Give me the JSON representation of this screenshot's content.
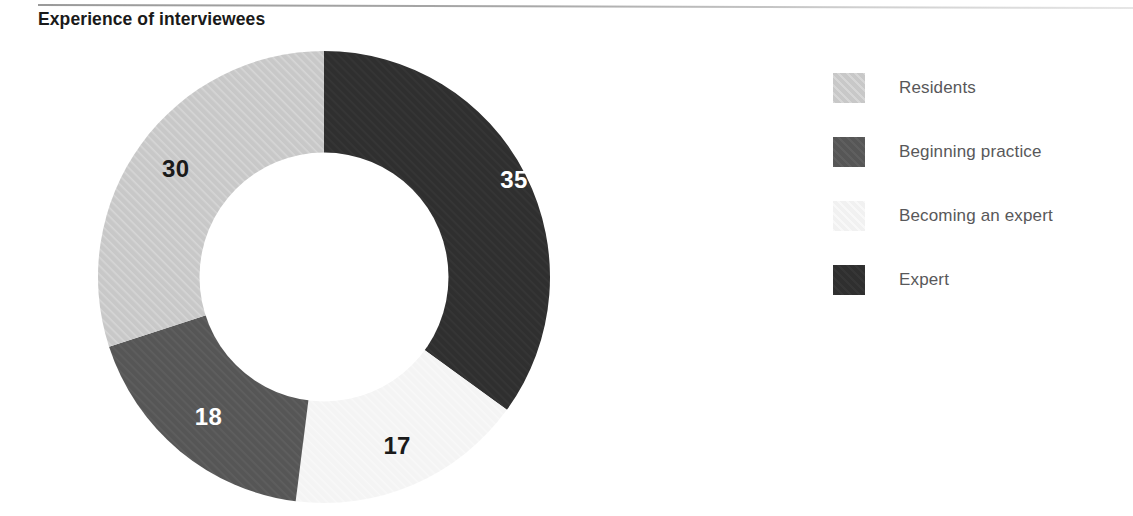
{
  "title": "Experience of interviewees",
  "colors": {
    "residents": "#c8c8c8",
    "beginning_practice": "#565656",
    "becoming_an_expert": "#f4f4f4",
    "expert": "#2f2f2f",
    "title_text": "#1a1a1a",
    "legend_text": "#58585a",
    "rule": "#a0a0a0"
  },
  "legend": {
    "items": [
      {
        "label": "Residents",
        "color": "#c8c8c8"
      },
      {
        "label": "Beginning practice",
        "color": "#565656"
      },
      {
        "label": "Becoming an expert",
        "color": "#f4f4f4"
      },
      {
        "label": "Expert",
        "color": "#2f2f2f"
      }
    ]
  },
  "chart_data": {
    "type": "pie",
    "variant": "donut",
    "title": "Experience of interviewees",
    "xlabel": "",
    "ylabel": "",
    "total": 100,
    "units": "count of interviewees",
    "hole_ratio": 0.55,
    "start_angle_deg": 0,
    "direction": "clockwise",
    "legend_position": "right",
    "grid": false,
    "categories": [
      "Expert",
      "Becoming an expert",
      "Beginning practice",
      "Residents"
    ],
    "values": [
      35,
      17,
      18,
      30
    ],
    "slices": [
      {
        "label": "Expert",
        "value": 35,
        "percent": 35,
        "color": "#2f2f2f",
        "label_color": "#ffffff",
        "start_deg": 0,
        "end_deg": 126
      },
      {
        "label": "Becoming an expert",
        "value": 17,
        "percent": 17,
        "color": "#f4f4f4",
        "label_color": "#1a1a1a",
        "start_deg": 126,
        "end_deg": 187.2
      },
      {
        "label": "Beginning practice",
        "value": 18,
        "percent": 18,
        "color": "#565656",
        "label_color": "#ffffff",
        "start_deg": 187.2,
        "end_deg": 252
      },
      {
        "label": "Residents",
        "value": 30,
        "percent": 30,
        "color": "#c8c8c8",
        "label_color": "#1a1a1a",
        "start_deg": 252,
        "end_deg": 360
      }
    ],
    "data_labels": [
      "35",
      "17",
      "18",
      "30"
    ]
  }
}
